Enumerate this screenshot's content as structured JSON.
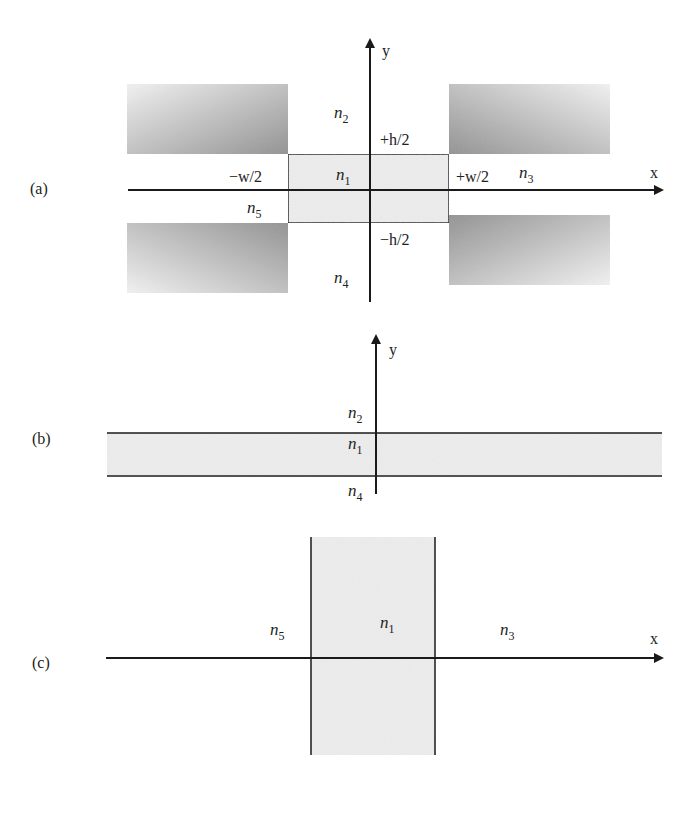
{
  "figure": {
    "panels": [
      {
        "id": "a",
        "label": "(a)",
        "axis_x_label": "x",
        "axis_y_label": "y",
        "regions": {
          "core": "n",
          "core_sub": "1",
          "top": "n",
          "top_sub": "2",
          "right": "n",
          "right_sub": "3",
          "bottom": "n",
          "bottom_sub": "4",
          "left": "n",
          "left_sub": "5"
        },
        "bounds": {
          "plus_h": "+h/2",
          "minus_h": "−h/2",
          "plus_w": "+w/2",
          "minus_w": "−w/2"
        }
      },
      {
        "id": "b",
        "label": "(b)",
        "axis_y_label": "y",
        "regions": {
          "top": "n",
          "top_sub": "2",
          "core": "n",
          "core_sub": "1",
          "bottom": "n",
          "bottom_sub": "4"
        }
      },
      {
        "id": "c",
        "label": "(c)",
        "axis_x_label": "x",
        "regions": {
          "left": "n",
          "left_sub": "5",
          "core": "n",
          "core_sub": "1",
          "right": "n",
          "right_sub": "3"
        }
      }
    ],
    "colors": {
      "axis": "#1a1a1a",
      "core_fill": "#eeeeee",
      "cladding_dark": "#8c8c8c",
      "cladding_light": "#f4f4f4"
    }
  }
}
